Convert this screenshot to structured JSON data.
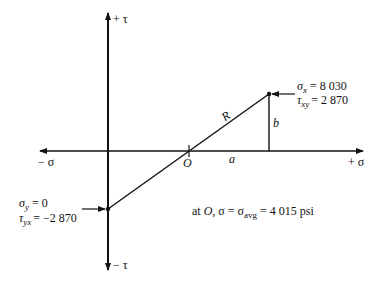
{
  "diagram": {
    "type": "mohr-circle-construction",
    "axes": {
      "pos_tau": "+ τ",
      "neg_tau": "− τ",
      "pos_sigma": "+ σ",
      "neg_sigma": "− σ"
    },
    "labels": {
      "center": "O",
      "radius": "R",
      "a": "a",
      "b": "b"
    },
    "point_x": {
      "sigma_sym": "σ",
      "sigma_sub": "x",
      "sigma_val": "=  8 030",
      "tau_sym": "τ",
      "tau_sub": "xy",
      "tau_val": "=  2 870"
    },
    "point_y": {
      "sigma_sym": "σ",
      "sigma_sub": "y",
      "sigma_val": "=  0",
      "tau_sym": "τ",
      "tau_sub": "yx",
      "tau_val": "=  −2 870"
    },
    "note": {
      "prefix": "at ",
      "o": "O",
      "mid": ", σ = σ",
      "sub": "avg",
      "suffix": " = 4 015 psi"
    }
  }
}
